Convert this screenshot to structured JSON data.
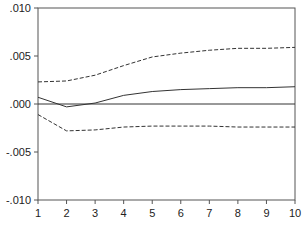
{
  "chart_data": {
    "type": "line",
    "title": "",
    "xlabel": "",
    "ylabel": "",
    "x": [
      1,
      2,
      3,
      4,
      5,
      6,
      7,
      8,
      9,
      10
    ],
    "xlim": [
      1,
      10
    ],
    "ylim": [
      -0.01,
      0.01
    ],
    "yticks": [
      ".010",
      ".005",
      ".000",
      "-.005",
      "-.010"
    ],
    "ytick_values": [
      0.01,
      0.005,
      0.0,
      -0.005,
      -0.01
    ],
    "xticks": [
      "1",
      "2",
      "3",
      "4",
      "5",
      "6",
      "7",
      "8",
      "9",
      "10"
    ],
    "grid": false,
    "legend": "none",
    "series": [
      {
        "name": "response",
        "style": "solid",
        "values": [
          0.0007,
          -0.0003,
          0.0001,
          0.0009,
          0.0013,
          0.0015,
          0.0016,
          0.0017,
          0.0017,
          0.0018
        ]
      },
      {
        "name": "upper band",
        "style": "dashed",
        "values": [
          0.0023,
          0.0024,
          0.003,
          0.004,
          0.0049,
          0.0053,
          0.0056,
          0.0058,
          0.0058,
          0.0059
        ]
      },
      {
        "name": "lower band",
        "style": "dashed",
        "values": [
          -0.0011,
          -0.0028,
          -0.0027,
          -0.0024,
          -0.0023,
          -0.0023,
          -0.0023,
          -0.0024,
          -0.0024,
          -0.0024
        ]
      }
    ],
    "zero_line": true
  },
  "colors": {
    "line": "#333333",
    "axis": "#555555"
  }
}
